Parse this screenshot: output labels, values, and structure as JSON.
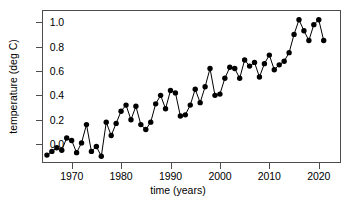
{
  "chart_data": {
    "type": "line",
    "title": "",
    "xlabel": "time (years)",
    "ylabel": "temperature (deg C)",
    "xlim": [
      1964.0,
      1974.0
    ],
    "ylim": [
      -0.15,
      1.1
    ],
    "grid": false,
    "legend": "none",
    "marker": "filled-circle",
    "line_color": "#000000",
    "marker_color": "#000000",
    "xticks": [
      1970,
      1980,
      1990,
      2000,
      2010,
      2020
    ],
    "yticks": [
      0.0,
      0.2,
      0.4,
      0.6,
      0.8,
      1.0
    ],
    "xticklabels": [
      "1970",
      "1980",
      "1990",
      "2000",
      "2010",
      "2020"
    ],
    "yticklabels": [
      "0.0",
      "0.2",
      "0.4",
      "0.6",
      "0.8",
      "1.0"
    ],
    "x": [
      1965,
      1966,
      1967,
      1968,
      1969,
      1970,
      1971,
      1972,
      1973,
      1974,
      1975,
      1976,
      1977,
      1978,
      1979,
      1980,
      1981,
      1982,
      1983,
      1984,
      1985,
      1986,
      1987,
      1988,
      1989,
      1990,
      1991,
      1992,
      1993,
      1994,
      1995,
      1996,
      1997,
      1998,
      1999,
      2000,
      2001,
      2002,
      2003,
      2004,
      2005,
      2006,
      2007,
      2008,
      2009,
      2010,
      2011,
      2012,
      2013,
      2014,
      2015,
      2016,
      2017,
      2018,
      2019,
      2020,
      2021
    ],
    "values": [
      -0.09,
      -0.06,
      -0.03,
      -0.05,
      0.05,
      0.03,
      -0.07,
      0.01,
      0.16,
      -0.06,
      -0.02,
      -0.1,
      0.18,
      0.07,
      0.17,
      0.27,
      0.32,
      0.2,
      0.31,
      0.16,
      0.12,
      0.18,
      0.33,
      0.4,
      0.29,
      0.44,
      0.42,
      0.23,
      0.24,
      0.32,
      0.45,
      0.34,
      0.47,
      0.62,
      0.4,
      0.41,
      0.54,
      0.63,
      0.62,
      0.54,
      0.69,
      0.64,
      0.67,
      0.55,
      0.66,
      0.73,
      0.61,
      0.65,
      0.68,
      0.75,
      0.9,
      1.02,
      0.93,
      0.85,
      0.98,
      1.02,
      0.85
    ]
  },
  "axes": {
    "x_title": "time (years)",
    "y_title": "temperature (deg C)"
  }
}
